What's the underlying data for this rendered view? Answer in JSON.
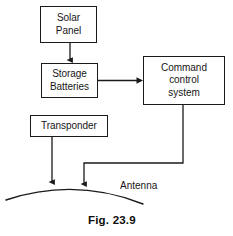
{
  "figure": {
    "caption": "Fig. 23.9",
    "caption_x": 88,
    "caption_y": 214
  },
  "nodes": [
    {
      "id": "solar-panel",
      "label": "Solar\nPanel",
      "x": 40,
      "y": 6,
      "width": 57,
      "height": 37
    },
    {
      "id": "storage-batteries",
      "label": "Storage\nBatteries",
      "x": 41,
      "y": 63,
      "width": 57,
      "height": 35
    },
    {
      "id": "command-control-system",
      "label": "Command\ncontrol\nsystem",
      "x": 143,
      "y": 56,
      "width": 82,
      "height": 49
    },
    {
      "id": "transponder",
      "label": "Transponder",
      "x": 30,
      "y": 115,
      "width": 78,
      "height": 22
    }
  ],
  "labels": [
    {
      "id": "antenna",
      "text": "Antenna",
      "x": 120,
      "y": 180
    }
  ],
  "connectors": [
    {
      "id": "solar-to-batteries",
      "from": "solar-panel",
      "to": "storage-batteries",
      "path": "M 70 43 L 70 60",
      "arrow_at": [
        70,
        63
      ]
    },
    {
      "id": "batteries-to-command",
      "from": "storage-batteries",
      "to": "command-control-system",
      "path": "M 98 80.5 L 140 80.5",
      "arrow_at": [
        143,
        80.5
      ]
    },
    {
      "id": "command-to-antenna",
      "from": "command-control-system",
      "to": "antenna-arc",
      "path": "M 183 105 L 183 163 L 84 163 L 84 184",
      "arrow_at": [
        84,
        188
      ]
    },
    {
      "id": "transponder-to-antenna",
      "from": "transponder",
      "to": "antenna-arc",
      "path": "M 52 137 L 52 182",
      "arrow_at": [
        52,
        186
      ]
    }
  ],
  "antenna_arc": {
    "id": "antenna-arc",
    "path": "M 6 200 Q 75 177 143 204"
  },
  "colors": {
    "stroke": "#1a1a1a",
    "text": "#161616",
    "background": "#ffffff"
  }
}
